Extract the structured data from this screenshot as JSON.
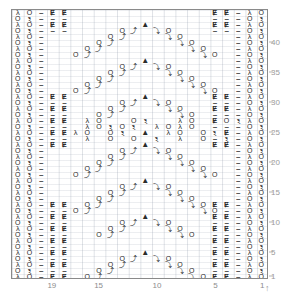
{
  "chart_data": {
    "type": "table",
    "title": "",
    "xlabel": "",
    "ylabel": "",
    "columns": 22,
    "rows": 45,
    "grid": true,
    "col_tick_labels": [
      "19",
      "15",
      "10",
      "5",
      "1"
    ],
    "col_tick_positions": [
      19,
      15,
      10,
      5,
      1
    ],
    "row_tick_labels": [
      "40",
      "35",
      "30",
      "25",
      "20",
      "15",
      "10",
      "5",
      "1"
    ],
    "row_tick_positions": [
      40,
      35,
      30,
      25,
      20,
      15,
      10,
      5,
      1
    ],
    "legend": [
      {
        "symbol": "O",
        "name": "yarn-over"
      },
      {
        "symbol": "–",
        "name": "purl"
      },
      {
        "symbol": "Ɇ",
        "name": "knit-through-back-loop"
      },
      {
        "symbol": "λ",
        "name": "ssk-left-decrease"
      },
      {
        "symbol": "ⲝ",
        "name": "k2tog-right-decrease"
      },
      {
        "symbol": "▲",
        "name": "centered-double-decrease"
      },
      {
        "symbol": "⤴",
        "name": "twisted-right"
      },
      {
        "symbol": "⤵",
        "name": "twisted-left"
      }
    ],
    "symbol_rows": [
      "..--P-P...........P-P--P-P.......P-P--",
      "LO--P-P...........P-P-LO-P-P.....P-P-LO-",
      "..--P-...O....A....O--P-....-P-..O....A....O--P--",
      "OR--P-..O...Y.Y...O...P--OR--P-..O...Y.Y...O..P--OR--",
      "..--..O...Y...Y...O....--...-..O...Y...Y..O...--",
      "LO--O...Y.....Y...O-LO-..O..Y.....Y..O--LO-",
      "OR--..O..Y.......Y..O..-OR-.O..Y.......Y.O...-OR-",
      "..--.O...Y.........Y...O.--..O..Y.........Y..O..--",
      "LO--O..Y....A....Y..O-LO-O.Y....A....Y.O--LO-",
      "OR--.O.Y...Y.Y...Y.O.-OR-.O.Y...Y.Y..Y.O.-OR-",
      "..--..O.Y..Y...Y..Y.O..--..O.Y..Y...Y..Y.O..--",
      "LO--.O.Y.Y.....Y.Y.O.-LO-.O.Y.Y....Y.Y.O.-LO-",
      "OR--..OY.Y.......Y.YO..-OR-..OY.Y......Y.YO..-OR-",
      "..--.OY...A...YO.--..OY...A...YO.--",
      "LO-P-..O.Y.Y.YO..P-LO-P-..O.Y.Y.YO..P-LO-",
      "OR-P-P.O.Y...Y.O.P-P-OR-P-P.O.Y...Y.O.P-P-OR-",
      "LO-P-P.LO....OR.P-P-LO-P-P.LO....OR.P-P-LO-",
      "OR-P-P.LO.OR.LO.OR.P-P-OR-P-P.LO.OR.LO.OR.P-P-OR-",
      "LO-P-P.LO.OROR..LOLO.P-P-LO-P-P.LO.OROR.LOLO.P-P-LO-",
      "OR-P-P-P.L.O.O.R.P-P-P-OR-P-P-P.L.O.O.R.P-P-P-OR-",
      "LO-P-P-P.LOLO..OROR.P-P-P-LO-P-P-P.LOLO.OROR.P-P-P-LO-",
      "OR-P-P-P..L..O..O..R..P-P-P-OR-P-P-P..L..O..O..R..P-P-P-OR-",
      "LO-P-..O...A...O..P-LO-P-..O...A...O..P-LO-",
      "OR--.O..Y.....Y..O.--OR--.O..Y.....Y..O.--OR-",
      "LO--O..Y.......Y..O--LO--O..Y.......Y..O--LO-",
      "OR--.O.Y....A....Y.O.-OR-.O.Y....A....Y.O.-OR-",
      "LO--..O.Y..Y.Y..Y.O..-LO-..O.Y..Y.Y..Y.O..-LO-",
      "OR--.O.Y.Y...Y.Y.O.-OR-.O.Y.Y...Y.Y.O.-OR-",
      "LO--..OY.Y.....Y.YO..-LO-..OY.Y.....Y.YO..-LO-",
      "OR--.OY..A..YO.-OR-.OY..A..YO.-OR-"
    ]
  },
  "labels": {
    "col_axis_name": "stitch-numbers",
    "row_axis_name": "row-numbers"
  }
}
